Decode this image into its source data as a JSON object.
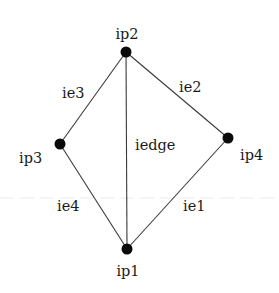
{
  "diagram": {
    "type": "graph",
    "nodes": [
      {
        "id": "ip1",
        "label": "ip1",
        "x": 127,
        "y": 249
      },
      {
        "id": "ip2",
        "label": "ip2",
        "x": 126,
        "y": 52
      },
      {
        "id": "ip3",
        "label": "ip3",
        "x": 60,
        "y": 144
      },
      {
        "id": "ip4",
        "label": "ip4",
        "x": 228,
        "y": 138
      }
    ],
    "edges": [
      {
        "id": "ie1",
        "label": "ie1",
        "from": "ip1",
        "to": "ip4"
      },
      {
        "id": "ie2",
        "label": "ie2",
        "from": "ip2",
        "to": "ip4"
      },
      {
        "id": "ie3",
        "label": "ie3",
        "from": "ip2",
        "to": "ip3"
      },
      {
        "id": "ie4",
        "label": "ie4",
        "from": "ip3",
        "to": "ip1"
      },
      {
        "id": "iedge",
        "label": "iedge",
        "from": "ip2",
        "to": "ip1"
      }
    ],
    "node_labels": {
      "ip1": "ip1",
      "ip2": "ip2",
      "ip3": "ip3",
      "ip4": "ip4"
    },
    "edge_labels": {
      "ie1": "ie1",
      "ie2": "ie2",
      "ie3": "ie3",
      "ie4": "ie4",
      "iedge": "iedge"
    },
    "colors": {
      "node": "#0a0a0a",
      "edge": "#3a3a3a",
      "text": "#1a1a1a",
      "background": "#ffffff"
    }
  }
}
